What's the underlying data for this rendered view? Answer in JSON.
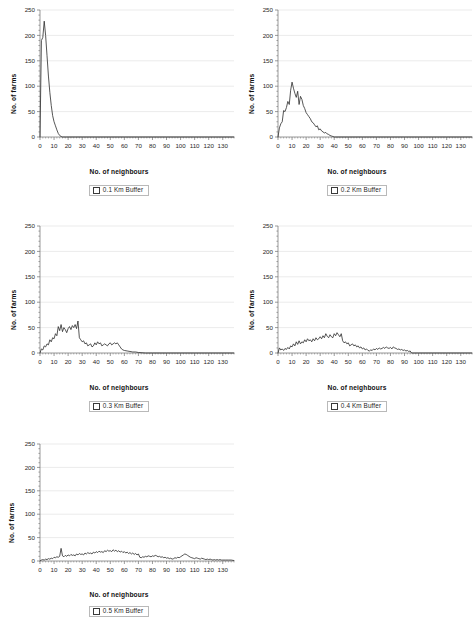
{
  "figure": {
    "background": "#ffffff",
    "line_color": "#2b2b2b",
    "grid_color": "#e2e2e2",
    "axis_color": "#6f6f6f"
  },
  "axes_common": {
    "xlabel": "No. of neighbours",
    "ylabel": "No. of farms",
    "yticks": [
      "0",
      "50",
      "100",
      "150",
      "200",
      "250"
    ],
    "xticks": [
      "0",
      "10",
      "20",
      "30",
      "40",
      "50",
      "60",
      "70",
      "80",
      "90",
      "100",
      "110",
      "120",
      "130"
    ]
  },
  "chart_data": [
    {
      "id": "buffer-0-1",
      "type": "line",
      "title": "",
      "legend": "0.1 Km Buffer",
      "xlabel": "No. of neighbours",
      "ylabel": "No. of farms",
      "xlim": [
        0,
        138
      ],
      "ylim": [
        0,
        250
      ],
      "xticks": [
        0,
        10,
        20,
        30,
        40,
        50,
        60,
        70,
        80,
        90,
        100,
        110,
        120,
        130
      ],
      "yticks": [
        0,
        50,
        100,
        150,
        200,
        250
      ],
      "grid": true,
      "legend_position": "below",
      "x": [
        0,
        1,
        2,
        3,
        4,
        5,
        6,
        7,
        8,
        9,
        10,
        11,
        12,
        13,
        14,
        15,
        16,
        17,
        18,
        19,
        20,
        25,
        30,
        40,
        50,
        60,
        70,
        80,
        90,
        100,
        110,
        120,
        130,
        138
      ],
      "values": [
        0,
        190,
        196,
        228,
        200,
        160,
        120,
        88,
        62,
        42,
        30,
        22,
        14,
        7,
        3,
        1,
        0,
        0,
        0,
        0,
        0,
        0,
        0,
        0,
        0,
        0,
        0,
        0,
        0,
        0,
        0,
        0,
        0,
        0
      ]
    },
    {
      "id": "buffer-0-2",
      "type": "line",
      "title": "",
      "legend": "0.2 Km Buffer",
      "xlabel": "No. of neighbours",
      "ylabel": "No. of farms",
      "xlim": [
        0,
        138
      ],
      "ylim": [
        0,
        250
      ],
      "xticks": [
        0,
        10,
        20,
        30,
        40,
        50,
        60,
        70,
        80,
        90,
        100,
        110,
        120,
        130
      ],
      "yticks": [
        0,
        50,
        100,
        150,
        200,
        250
      ],
      "grid": true,
      "legend_position": "below",
      "x": [
        0,
        1,
        2,
        3,
        4,
        5,
        6,
        7,
        8,
        9,
        10,
        11,
        12,
        13,
        14,
        15,
        16,
        17,
        18,
        19,
        20,
        21,
        22,
        23,
        24,
        25,
        26,
        27,
        28,
        29,
        30,
        31,
        32,
        33,
        34,
        35,
        36,
        37,
        38,
        39,
        40,
        50,
        60,
        70,
        80,
        90,
        100,
        110,
        120,
        130,
        138
      ],
      "values": [
        0,
        18,
        26,
        30,
        52,
        50,
        58,
        70,
        64,
        92,
        108,
        96,
        86,
        78,
        90,
        64,
        80,
        74,
        62,
        56,
        48,
        44,
        40,
        36,
        30,
        28,
        24,
        20,
        22,
        14,
        16,
        12,
        10,
        8,
        9,
        6,
        5,
        3,
        2,
        1,
        0,
        0,
        0,
        0,
        0,
        0,
        0,
        0,
        0,
        0,
        0
      ]
    },
    {
      "id": "buffer-0-3",
      "type": "line",
      "title": "",
      "legend": "0.3 Km Buffer",
      "xlabel": "No. of neighbours",
      "ylabel": "No. of farms",
      "xlim": [
        0,
        138
      ],
      "ylim": [
        0,
        250
      ],
      "xticks": [
        0,
        10,
        20,
        30,
        40,
        50,
        60,
        70,
        80,
        90,
        100,
        110,
        120,
        130
      ],
      "yticks": [
        0,
        50,
        100,
        150,
        200,
        250
      ],
      "grid": true,
      "legend_position": "below",
      "x": [
        0,
        1,
        2,
        3,
        4,
        5,
        6,
        7,
        8,
        9,
        10,
        11,
        12,
        13,
        14,
        15,
        16,
        17,
        18,
        19,
        20,
        21,
        22,
        23,
        24,
        25,
        26,
        27,
        28,
        29,
        30,
        31,
        32,
        33,
        34,
        35,
        36,
        37,
        38,
        39,
        40,
        41,
        42,
        43,
        44,
        45,
        46,
        47,
        48,
        49,
        50,
        51,
        52,
        53,
        54,
        55,
        56,
        57,
        58,
        59,
        60,
        62,
        64,
        66,
        68,
        70,
        75,
        80,
        90,
        100,
        110,
        120,
        130,
        138
      ],
      "values": [
        0,
        8,
        6,
        14,
        12,
        18,
        16,
        26,
        22,
        30,
        28,
        38,
        34,
        52,
        44,
        56,
        42,
        50,
        46,
        40,
        48,
        52,
        46,
        54,
        50,
        56,
        48,
        63,
        30,
        26,
        22,
        24,
        18,
        20,
        14,
        16,
        18,
        12,
        14,
        20,
        16,
        22,
        18,
        20,
        14,
        16,
        18,
        16,
        14,
        18,
        20,
        16,
        18,
        20,
        18,
        20,
        16,
        12,
        8,
        6,
        5,
        4,
        3,
        2,
        2,
        1,
        0,
        0,
        0,
        0,
        0,
        0,
        0,
        0
      ]
    },
    {
      "id": "buffer-0-4",
      "type": "line",
      "title": "",
      "legend": "0.4 Km Buffer",
      "xlabel": "No. of neighbours",
      "ylabel": "No. of farms",
      "xlim": [
        0,
        138
      ],
      "ylim": [
        0,
        250
      ],
      "xticks": [
        0,
        10,
        20,
        30,
        40,
        50,
        60,
        70,
        80,
        90,
        100,
        110,
        120,
        130
      ],
      "yticks": [
        0,
        50,
        100,
        150,
        200,
        250
      ],
      "grid": true,
      "legend_position": "below",
      "x": [
        0,
        1,
        2,
        3,
        4,
        5,
        6,
        7,
        8,
        9,
        10,
        11,
        12,
        13,
        14,
        15,
        16,
        17,
        18,
        19,
        20,
        21,
        22,
        23,
        24,
        25,
        26,
        27,
        28,
        29,
        30,
        31,
        32,
        33,
        34,
        35,
        36,
        37,
        38,
        39,
        40,
        41,
        42,
        43,
        44,
        45,
        46,
        47,
        48,
        49,
        50,
        51,
        52,
        53,
        54,
        55,
        56,
        57,
        58,
        59,
        60,
        61,
        62,
        63,
        64,
        65,
        66,
        67,
        68,
        69,
        70,
        71,
        72,
        73,
        74,
        75,
        76,
        77,
        78,
        79,
        80,
        81,
        82,
        83,
        84,
        85,
        86,
        87,
        88,
        89,
        90,
        91,
        92,
        93,
        94,
        95,
        100,
        110,
        120,
        130,
        138
      ],
      "values": [
        0,
        10,
        6,
        8,
        5,
        9,
        7,
        11,
        8,
        14,
        12,
        18,
        14,
        22,
        17,
        24,
        18,
        22,
        20,
        26,
        22,
        28,
        24,
        26,
        22,
        28,
        24,
        30,
        26,
        28,
        32,
        28,
        34,
        30,
        38,
        33,
        30,
        36,
        32,
        30,
        38,
        34,
        40,
        36,
        32,
        38,
        24,
        20,
        22,
        18,
        20,
        14,
        16,
        18,
        14,
        16,
        12,
        14,
        10,
        12,
        8,
        10,
        6,
        8,
        5,
        4,
        6,
        5,
        8,
        6,
        9,
        7,
        10,
        8,
        9,
        11,
        9,
        12,
        10,
        9,
        11,
        8,
        12,
        10,
        9,
        7,
        8,
        6,
        7,
        5,
        6,
        4,
        5,
        3,
        4,
        0,
        0,
        0,
        0,
        0,
        0
      ]
    },
    {
      "id": "buffer-0-5",
      "type": "line",
      "title": "",
      "legend": "0.5 Km Buffer",
      "xlabel": "No. of neighbours",
      "ylabel": "No. of farms",
      "xlim": [
        0,
        138
      ],
      "ylim": [
        0,
        250
      ],
      "xticks": [
        0,
        10,
        20,
        30,
        40,
        50,
        60,
        70,
        80,
        90,
        100,
        110,
        120,
        130
      ],
      "yticks": [
        0,
        50,
        100,
        150,
        200,
        250
      ],
      "grid": true,
      "legend_position": "below",
      "x": [
        0,
        1,
        2,
        3,
        4,
        5,
        6,
        7,
        8,
        9,
        10,
        11,
        12,
        13,
        14,
        15,
        16,
        17,
        18,
        19,
        20,
        21,
        22,
        23,
        24,
        25,
        26,
        27,
        28,
        29,
        30,
        31,
        32,
        33,
        34,
        35,
        36,
        37,
        38,
        39,
        40,
        41,
        42,
        43,
        44,
        45,
        46,
        47,
        48,
        49,
        50,
        51,
        52,
        53,
        54,
        55,
        56,
        57,
        58,
        59,
        60,
        61,
        62,
        63,
        64,
        65,
        66,
        67,
        68,
        69,
        70,
        71,
        72,
        73,
        74,
        75,
        76,
        77,
        78,
        79,
        80,
        81,
        82,
        83,
        84,
        85,
        86,
        87,
        88,
        89,
        90,
        91,
        92,
        93,
        94,
        95,
        96,
        97,
        98,
        99,
        100,
        101,
        102,
        103,
        104,
        105,
        106,
        107,
        108,
        109,
        110,
        111,
        112,
        113,
        114,
        115,
        116,
        117,
        118,
        119,
        120,
        121,
        122,
        123,
        124,
        125,
        126,
        127,
        128,
        129,
        130,
        132,
        134,
        136,
        138
      ],
      "values": [
        0,
        2,
        3,
        2,
        4,
        3,
        5,
        4,
        6,
        5,
        8,
        7,
        9,
        8,
        10,
        27,
        11,
        9,
        12,
        10,
        13,
        11,
        14,
        12,
        13,
        11,
        15,
        13,
        16,
        14,
        15,
        13,
        17,
        15,
        18,
        16,
        17,
        15,
        19,
        17,
        20,
        18,
        21,
        19,
        20,
        18,
        22,
        20,
        23,
        21,
        22,
        20,
        24,
        21,
        23,
        20,
        22,
        19,
        21,
        18,
        20,
        17,
        19,
        16,
        18,
        15,
        17,
        14,
        16,
        13,
        15,
        8,
        7,
        9,
        8,
        10,
        9,
        11,
        10,
        9,
        11,
        10,
        12,
        11,
        9,
        10,
        8,
        9,
        7,
        8,
        6,
        7,
        5,
        6,
        4,
        5,
        7,
        6,
        8,
        7,
        9,
        11,
        13,
        15,
        14,
        12,
        10,
        8,
        7,
        6,
        5,
        7,
        6,
        5,
        4,
        6,
        5,
        4,
        3,
        4,
        3,
        4,
        3,
        2,
        3,
        2,
        3,
        2,
        3,
        2,
        2,
        2,
        2,
        2,
        1
      ]
    }
  ]
}
